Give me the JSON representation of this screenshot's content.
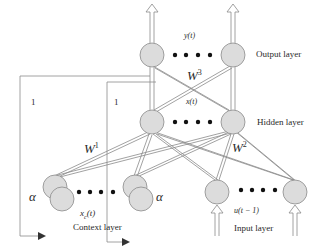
{
  "diagram": {
    "type": "Elman recurrent neural network",
    "layers": {
      "output": {
        "label": "Output layer",
        "variable": "y(t)"
      },
      "hidden": {
        "label": "Hidden layer",
        "variable": "x(t)"
      },
      "context": {
        "label": "Context layer",
        "variable_base": "x",
        "variable_sub": "c",
        "variable_arg": "(t)"
      },
      "input": {
        "label": "Input layer",
        "variable": "u(t − 1)"
      }
    },
    "weights": {
      "w1": {
        "base": "W",
        "sup": "1"
      },
      "w2": {
        "base": "W",
        "sup": "2"
      },
      "w3": {
        "base": "W",
        "sup": "3"
      }
    },
    "feedback": {
      "left_gain": "1",
      "right_gain": "1",
      "alpha_left": "α",
      "alpha_right": "α"
    },
    "colors": {
      "node_fill": "#dcdcdc",
      "node_stroke": "#8a8a8a",
      "line": "#7a7a7a",
      "dot": "#111111"
    }
  }
}
